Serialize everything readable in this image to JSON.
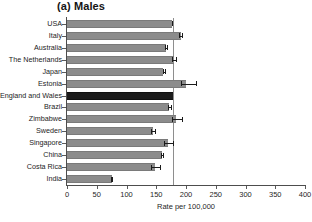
{
  "chart_data": {
    "type": "bar",
    "orientation": "horizontal",
    "title": "(a) Males",
    "xlabel": "Rate per 100,000",
    "ylabel": "",
    "xlim": [
      0,
      400
    ],
    "xticks": [
      0,
      50,
      100,
      150,
      200,
      250,
      300,
      350,
      400
    ],
    "xtick_labels": [
      "0",
      "50",
      "100",
      "150",
      "200",
      "250",
      "300",
      "350",
      "400"
    ],
    "grid": false,
    "legend": "none",
    "reference_line": 178,
    "highlight_category": "England and Wales",
    "bar_color": "#8c8c8c",
    "highlight_color": "#1c1c1c",
    "categories": [
      "USA",
      "Italy",
      "Australia",
      "The Netherlands",
      "Japan",
      "Estonia",
      "England and Wales",
      "Brazil",
      "Zimbabwe",
      "Sweden",
      "Singapore",
      "China",
      "Costa Rica",
      "India"
    ],
    "values": [
      176,
      191,
      166,
      180,
      162,
      200,
      178,
      172,
      184,
      144,
      170,
      160,
      148,
      75
    ],
    "err_low": [
      176,
      189,
      165,
      177,
      161,
      192,
      178,
      170,
      176,
      141,
      163,
      158,
      141,
      74
    ],
    "err_high": [
      177,
      193,
      168,
      184,
      164,
      217,
      178,
      175,
      193,
      148,
      178,
      162,
      157,
      76
    ]
  }
}
